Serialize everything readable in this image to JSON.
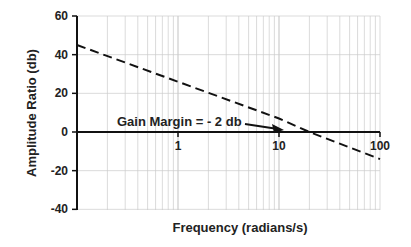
{
  "chart_data": {
    "type": "line",
    "title": "",
    "xlabel": "Frequency   (radians/s)",
    "ylabel": "Amplitude Ratio (db)",
    "xscale": "log",
    "xlim": [
      0.1,
      100
    ],
    "ylim": [
      -40,
      60
    ],
    "xticks": [
      "1",
      "10",
      "100"
    ],
    "yticks": [
      "60",
      "40",
      "20",
      "0",
      "-20",
      "-40"
    ],
    "grid": true,
    "series": [
      {
        "name": "Amplitude ratio",
        "style": "dashed",
        "x": [
          0.1,
          1,
          10,
          20,
          100
        ],
        "y": [
          45,
          26,
          7,
          0,
          -14
        ]
      }
    ],
    "annotations": [
      {
        "text": "Gain Margin = - 2 db",
        "arrow_to": {
          "x": 10,
          "y": 0
        }
      }
    ]
  },
  "axes": {
    "xlabel": "Frequency   (radians/s)",
    "ylabel": "Amplitude Ratio (db)",
    "yticks": [
      "60",
      "40",
      "20",
      "0",
      "-20",
      "-40"
    ],
    "xticks": [
      "1",
      "10",
      "100"
    ]
  },
  "annotation": "Gain Margin = - 2 db"
}
